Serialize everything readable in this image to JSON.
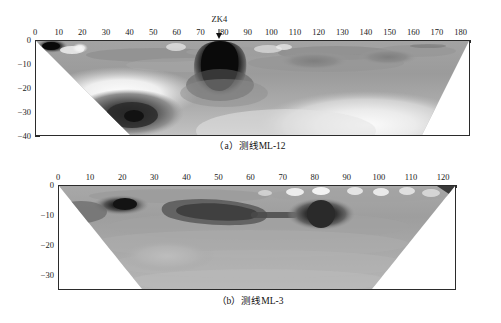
{
  "figure": {
    "panels": [
      {
        "id": "panel-a",
        "caption": "（a）测线ML-12",
        "xaxis": {
          "min": 0,
          "max": 184,
          "ticks": [
            0,
            10,
            20,
            30,
            40,
            50,
            60,
            70,
            80,
            90,
            100,
            110,
            120,
            130,
            140,
            150,
            160,
            170,
            180
          ],
          "minor_step": 2,
          "position": "top"
        },
        "yaxis": {
          "min": -40,
          "max": 0,
          "ticks": [
            0,
            -10,
            -20,
            -30,
            -40
          ],
          "labels": [
            "0",
            "−10",
            "−20",
            "−30",
            "−40"
          ],
          "minor_step": 2,
          "position": "left"
        },
        "borehole": {
          "label": "ZK4",
          "x": 78
        }
      },
      {
        "id": "panel-b",
        "caption": "（b）测线ML-3",
        "xaxis": {
          "min": 0,
          "max": 124,
          "ticks": [
            0,
            10,
            20,
            30,
            40,
            50,
            60,
            70,
            80,
            90,
            100,
            110,
            120
          ],
          "minor_step": 2,
          "position": "top"
        },
        "yaxis": {
          "min": -35,
          "max": 0,
          "ticks": [
            0,
            -10,
            -20,
            -30
          ],
          "labels": [
            "0",
            "−10",
            "−20",
            "−30"
          ],
          "minor_step": 2,
          "position": "left"
        },
        "borehole": null
      }
    ]
  },
  "chart_data": [
    {
      "type": "heatmap",
      "title": "（a）测线ML-12",
      "xlabel": "",
      "ylabel": "",
      "xlim": [
        0,
        184
      ],
      "ylim": [
        -40,
        0
      ],
      "grid": false,
      "colormap": "grayscale",
      "xticks": [
        0,
        10,
        20,
        30,
        40,
        50,
        60,
        70,
        80,
        90,
        100,
        110,
        120,
        130,
        140,
        150,
        160,
        170,
        180
      ],
      "yticks": [
        0,
        -10,
        -20,
        -30,
        -40
      ],
      "annotations": [
        {
          "text": "ZK4",
          "x": 78,
          "y": 0,
          "marker": "down-arrow"
        }
      ],
      "anomalies": [
        {
          "name": "near-surface-dark-blob-left",
          "x": 6,
          "y": -2,
          "extent_x": 10,
          "extent_y": 4,
          "intensity": "very-dark"
        },
        {
          "name": "bright-spot-left",
          "x": 18,
          "y": -2,
          "extent_x": 5,
          "extent_y": 3,
          "intensity": "very-light"
        },
        {
          "name": "deep-dark-core",
          "x": 38,
          "y": -30,
          "extent_x": 26,
          "extent_y": 16,
          "intensity": "very-dark"
        },
        {
          "name": "teardrop-dark-plume",
          "x": 78,
          "y": -12,
          "extent_x": 20,
          "extent_y": 24,
          "intensity": "very-dark"
        },
        {
          "name": "bright-halo-lower-left",
          "x": 28,
          "y": -21,
          "extent_x": 40,
          "extent_y": 8,
          "intensity": "very-light"
        },
        {
          "name": "bright-zone-lower-right",
          "x": 140,
          "y": -33,
          "extent_x": 60,
          "extent_y": 14,
          "intensity": "light"
        },
        {
          "name": "mid-gray-lens-right",
          "x": 118,
          "y": -9,
          "extent_x": 30,
          "extent_y": 6,
          "intensity": "mid-dark"
        }
      ],
      "geometry": {
        "shape": "trapezoid",
        "top_left_x": 0,
        "top_right_x": 184,
        "bottom_left_x": 40,
        "bottom_right_x": 166,
        "top_y": 0,
        "bottom_y": -40
      }
    },
    {
      "type": "heatmap",
      "title": "（b）测线ML-3",
      "xlabel": "",
      "ylabel": "",
      "xlim": [
        0,
        124
      ],
      "ylim": [
        -35,
        0
      ],
      "grid": false,
      "colormap": "grayscale",
      "xticks": [
        0,
        10,
        20,
        30,
        40,
        50,
        60,
        70,
        80,
        90,
        100,
        110,
        120
      ],
      "yticks": [
        0,
        -10,
        -20,
        -30
      ],
      "annotations": [],
      "anomalies": [
        {
          "name": "dark-blob-shallow-left",
          "x": 18,
          "y": -6,
          "extent_x": 10,
          "extent_y": 5,
          "intensity": "very-dark"
        },
        {
          "name": "dark-band-center",
          "x": 52,
          "y": -9,
          "extent_x": 22,
          "extent_y": 7,
          "intensity": "dark"
        },
        {
          "name": "dark-circle-right",
          "x": 85,
          "y": -8,
          "extent_x": 8,
          "extent_y": 6,
          "intensity": "very-dark"
        },
        {
          "name": "bright-surface-spots",
          "x": 98,
          "y": -2,
          "extent_x": 40,
          "extent_y": 3,
          "intensity": "very-light"
        },
        {
          "name": "light-lens-lower-left",
          "x": 34,
          "y": -22,
          "extent_x": 26,
          "extent_y": 8,
          "intensity": "light"
        }
      ],
      "geometry": {
        "shape": "trapezoid",
        "top_left_x": 0,
        "top_right_x": 124,
        "bottom_left_x": 26,
        "bottom_right_x": 98,
        "top_y": 0,
        "bottom_y": -35
      }
    }
  ]
}
